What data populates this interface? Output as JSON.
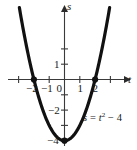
{
  "figure": {
    "name": "parabola-graph",
    "background_color": "#ffffff",
    "curve_color": "#111111",
    "axis_color": "#3a3a3a",
    "text_color": "#1a1a1a"
  },
  "axes": {
    "x_axis_label": "t",
    "y_axis_label": "s",
    "x_ticks": [
      {
        "value": -2,
        "label": "−2"
      },
      {
        "value": -1,
        "label": "−1"
      },
      {
        "value": 1,
        "label": "1"
      },
      {
        "value": 2,
        "label": "2"
      }
    ],
    "y_ticks": [
      {
        "value": 1,
        "label": "1"
      },
      {
        "value": -2,
        "label": "−2"
      },
      {
        "value": -4,
        "label": "−4"
      }
    ],
    "origin_label": "0"
  },
  "equation": {
    "lhs": "s",
    "equals": "=",
    "variable": "t",
    "exponent": "2",
    "minus": "−",
    "constant": "4",
    "full_text": "s = t² − 4"
  },
  "chart_data": {
    "type": "line",
    "title": "",
    "xlabel": "t",
    "ylabel": "s",
    "equation": "s = t^2 - 4",
    "xlim": [
      -2.9,
      2.9
    ],
    "ylim": [
      -4.6,
      4.2
    ],
    "grid": false,
    "legend": "none",
    "series": [
      {
        "name": "s = t^2 - 4",
        "x": [
          -2.75,
          -2.5,
          -2.25,
          -2.0,
          -1.75,
          -1.5,
          -1.25,
          -1.0,
          -0.75,
          -0.5,
          -0.25,
          0.0,
          0.25,
          0.5,
          0.75,
          1.0,
          1.25,
          1.5,
          1.75,
          2.0,
          2.25,
          2.5,
          2.75
        ],
        "y": [
          3.5625,
          2.25,
          1.0625,
          0.0,
          -0.9375,
          -1.75,
          -2.4375,
          -3.0,
          -3.4375,
          -3.75,
          -3.9375,
          -4.0,
          -3.9375,
          -3.75,
          -3.4375,
          -3.0,
          -2.4375,
          -1.75,
          -0.9375,
          0.0,
          1.0625,
          2.25,
          3.5625
        ]
      }
    ],
    "marked_points": [
      {
        "x": -2,
        "y": 0,
        "label": "root"
      },
      {
        "x": 2,
        "y": 0,
        "label": "root"
      },
      {
        "x": 0,
        "y": -4,
        "label": "vertex"
      }
    ],
    "x_ticks": [
      -2,
      -1,
      1,
      2
    ],
    "y_ticks": [
      1,
      -2,
      -4
    ]
  }
}
